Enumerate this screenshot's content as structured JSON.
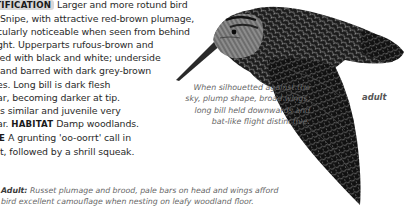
{
  "species_text": {
    "label_identification": "IDENTIFICATION",
    "lines": [
      "Larger and more rotund bird",
      "Snipe, with attractive red-brown plumage,",
      "cularly noticeable when seen from behind",
      "ght. Upperparts rufous-brown and",
      "led with black and white; underside",
      "and barred with dark grey-brown",
      "es. Long bill is dark flesh",
      "ar, becoming darker at tip.",
      "s similar and juvenile very",
      "ar.",
      "Damp woodlands.",
      "A grunting 'oo-oorrt' call in",
      "t, followed by a shrill squeak."
    ],
    "label_habitat": "HABITAT",
    "label_voice_fragment": "E",
    "line_prefix_5": "",
    "line_prefix_6": ""
  },
  "flight_caption": {
    "lines": [
      "When silhouetted against the",
      "sky, plump shape, broad wings,",
      "long bill held downwards and",
      "bat-like flight distinctive."
    ]
  },
  "illustration": {
    "subject": "woodcock in flight",
    "label": "adult"
  },
  "adult_caption": {
    "lead": "Adult:",
    "line1": "Russet plumage and brood, pale bars on head and wings afford",
    "line2": "bird excellent camouflage when nesting on leafy woodland floor."
  },
  "colors": {
    "text": "#2a2a2a",
    "caption": "#666666",
    "label_bg": "#d8d8d8"
  }
}
